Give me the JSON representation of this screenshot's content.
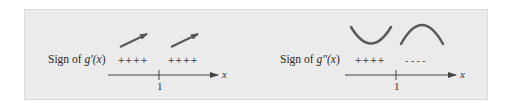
{
  "left_panel": {
    "label_prefix": "Sign of ",
    "function": "g′(",
    "variable": "x",
    "close": ")",
    "signs": [
      "++++",
      "++++"
    ],
    "behavior_icons": [
      "increasing-arrow",
      "increasing-arrow"
    ],
    "axis_tick": "1",
    "axis_variable": "x"
  },
  "right_panel": {
    "label_prefix": "Sign of ",
    "function": "g″(",
    "variable": "x",
    "close": ")",
    "signs": [
      "++++",
      "----"
    ],
    "behavior_icons": [
      "concave-up-curve",
      "concave-down-curve"
    ],
    "axis_tick": "1",
    "axis_variable": "x"
  },
  "colors": {
    "panel_bg": "#ebebeb",
    "stroke": "#5a5a5a",
    "text": "#2a2a2a"
  }
}
